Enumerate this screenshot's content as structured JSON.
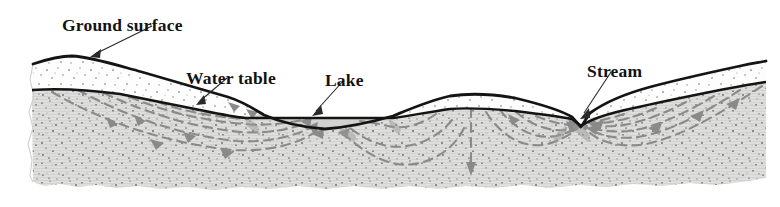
{
  "figure": {
    "name": "groundwater-flow-cross-section",
    "title_text": "",
    "colors": {
      "background": "#ffffff",
      "outline": "#141414",
      "unsaturated_fill": "#fdfdfd",
      "saturated_fill": "#dededc",
      "lake_water_fill": "#d2d2d0",
      "speckle": "#6f6f6f",
      "flowline": "#8a8a8a",
      "label_text": "#121212",
      "leader_line": "#2a2a2a"
    },
    "labels": [
      {
        "id": "ground-surface",
        "text": "Ground surface",
        "x": 62,
        "y": 18,
        "leader": {
          "x1": 152,
          "y1": 26,
          "x2": 92,
          "y2": 57
        }
      },
      {
        "id": "water-table",
        "text": "Water table",
        "x": 186,
        "y": 71,
        "leader": {
          "x1": 227,
          "y1": 78,
          "x2": 197,
          "y2": 104
        }
      },
      {
        "id": "lake",
        "text": "Lake",
        "x": 325,
        "y": 73,
        "leader": {
          "x1": 344,
          "y1": 80,
          "x2": 313,
          "y2": 115
        }
      },
      {
        "id": "stream",
        "text": "Stream",
        "x": 587,
        "y": 64,
        "leader": {
          "x1": 611,
          "y1": 72,
          "x2": 580,
          "y2": 118
        }
      }
    ],
    "features": {
      "lake_surface_level_y": 118,
      "lake_left_x": 248,
      "lake_right_x": 393,
      "stream_notch_x": 581,
      "groundwater_divide_x": 471,
      "block_left_x": 30,
      "block_right_x": 766,
      "block_bottom_y": 186
    },
    "zones": [
      {
        "id": "unsaturated-zone",
        "name": "unsaturated zone",
        "pattern": "sparse stipple on white"
      },
      {
        "id": "saturated-zone",
        "name": "saturated zone",
        "pattern": "dense stipple on gray"
      }
    ],
    "flow_arrows_count": 14
  }
}
